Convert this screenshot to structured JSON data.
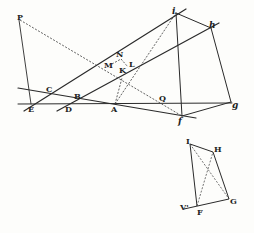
{
  "diagram": {
    "type": "geometric-construction",
    "colors": {
      "ink": "#2a2a2a",
      "background": "#fdfdfb"
    },
    "labels": {
      "P": "P",
      "E": "E",
      "D": "D",
      "A": "A",
      "B": "B",
      "C": "C",
      "Q": "Q",
      "N": "N",
      "M": "M",
      "K": "K",
      "L": "L",
      "i": "i",
      "h": "h",
      "f": "f",
      "g": "g",
      "I": "I",
      "H": "H",
      "G": "G",
      "F": "F",
      "V": "V'"
    }
  }
}
